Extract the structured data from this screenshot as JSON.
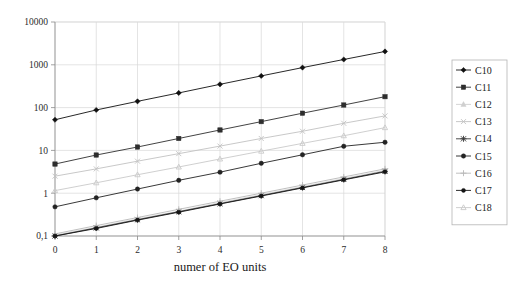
{
  "chart_data": {
    "type": "line",
    "title": "",
    "xlabel": "numer of EO units",
    "ylabel": "",
    "x": [
      0,
      1,
      2,
      3,
      4,
      5,
      6,
      7,
      8
    ],
    "xtick_labels": [
      "0",
      "1",
      "2",
      "3",
      "4",
      "5",
      "6",
      "7",
      "8"
    ],
    "ytick_labels": [
      "0,1",
      "1",
      "10",
      "100",
      "1000",
      "10000"
    ],
    "ytick_values": [
      0.1,
      1,
      10,
      100,
      1000,
      10000
    ],
    "yscale": "log",
    "ylim": [
      0.1,
      10000
    ],
    "xlim": [
      0,
      8
    ],
    "grid": true,
    "legend_position": "right",
    "series": [
      {
        "name": "C10",
        "marker": "diamond",
        "color": "#101010",
        "values": [
          52,
          88,
          140,
          220,
          350,
          550,
          860,
          1330,
          2050
        ]
      },
      {
        "name": "C11",
        "marker": "square",
        "color": "#2e2e2e",
        "values": [
          4.8,
          7.8,
          12,
          19,
          30,
          47,
          74,
          115,
          180
        ]
      },
      {
        "name": "C12",
        "marker": "triangle",
        "color": "#cfcfcf",
        "values": [
          0.105,
          0.16,
          0.25,
          0.38,
          0.6,
          0.92,
          1.42,
          2.2,
          3.4
        ]
      },
      {
        "name": "C13",
        "marker": "cross",
        "color": "#c2c2c2",
        "values": [
          2.5,
          3.7,
          5.6,
          8.4,
          12.6,
          19,
          28,
          43,
          64
        ]
      },
      {
        "name": "C14",
        "marker": "asterisk",
        "color": "#3a3a3a",
        "values": [
          0.1,
          0.155,
          0.24,
          0.37,
          0.57,
          0.88,
          1.36,
          2.1,
          3.25
        ]
      },
      {
        "name": "C15",
        "marker": "circle",
        "color": "#232323",
        "values": [
          0.48,
          0.78,
          1.25,
          2.0,
          3.1,
          5.0,
          7.9,
          12.5,
          15.5
        ]
      },
      {
        "name": "C16",
        "marker": "plus",
        "color": "#b8b8b8",
        "values": [
          0.112,
          0.175,
          0.27,
          0.42,
          0.65,
          1.0,
          1.55,
          2.4,
          3.7
        ]
      },
      {
        "name": "C17",
        "marker": "dot",
        "color": "#151515",
        "values": [
          0.1,
          0.15,
          0.235,
          0.36,
          0.56,
          0.86,
          1.33,
          2.05,
          3.15
        ]
      },
      {
        "name": "C18",
        "marker": "open-triangle",
        "color": "#cacaca",
        "values": [
          1.15,
          1.75,
          2.7,
          4.1,
          6.3,
          9.6,
          14.6,
          22,
          34
        ]
      }
    ]
  }
}
